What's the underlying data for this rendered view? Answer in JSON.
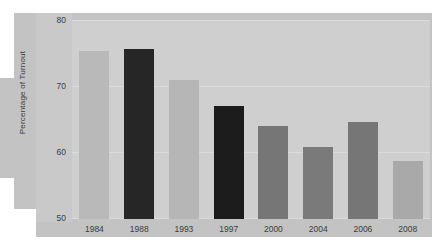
{
  "chart_data": {
    "type": "bar",
    "title": "",
    "subtitle": "",
    "xlabel": "",
    "ylabel": "Percentage of Turnout",
    "categories": [
      "1984",
      "1988",
      "1993",
      "1997",
      "2000",
      "2004",
      "2006",
      "2008"
    ],
    "values": [
      75.4,
      75.6,
      70.9,
      67.1,
      64.1,
      60.8,
      64.7,
      58.8
    ],
    "bar_colors": [
      "#b9b9b9",
      "#262626",
      "#b6b6b6",
      "#1c1c1c",
      "#767676",
      "#7a7a7a",
      "#767676",
      "#a9a9a9"
    ],
    "ylim": [
      50,
      80
    ],
    "yticks": [
      50,
      60,
      70,
      80
    ],
    "ytick_labels": [
      "50",
      "60",
      "70",
      "80"
    ],
    "grid": true,
    "legend": "none",
    "series": [
      {
        "name": "Percentage of Turnout",
        "values": [
          75.4,
          75.6,
          70.9,
          67.1,
          64.1,
          60.8,
          64.7,
          58.8
        ]
      }
    ]
  },
  "figure": {
    "background_color": "#ffffff",
    "outer_panel_color": "#c3c3c3",
    "plot_area_color": "#cfcfcf",
    "axis_strip_color": "#c9c9c9",
    "gridline_color": "#dcdcdc",
    "tick_text_color": "#3c3c3c"
  }
}
